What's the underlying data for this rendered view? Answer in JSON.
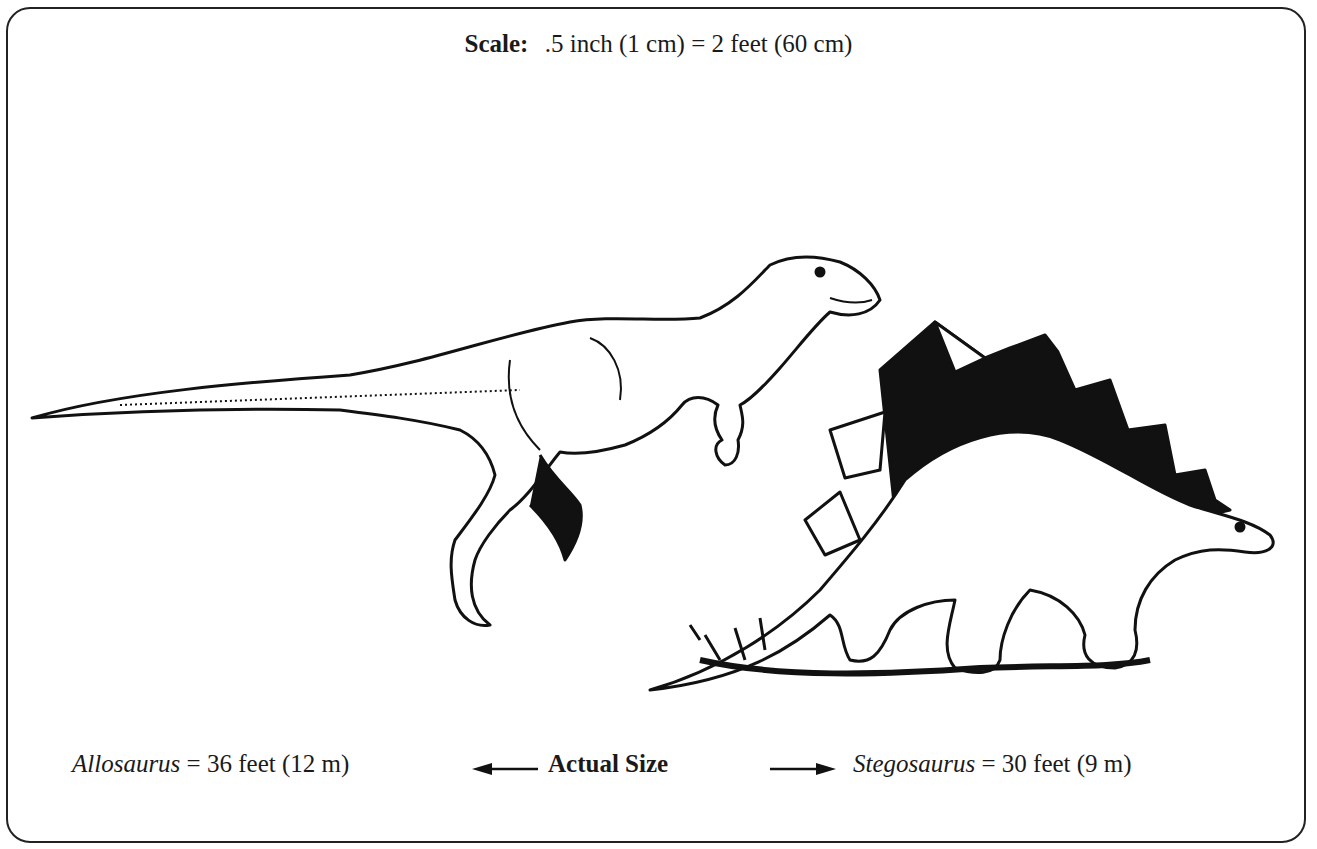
{
  "scale": {
    "label": "Scale:",
    "value": ".5 inch (1 cm) = 2 feet (60 cm)"
  },
  "figures": [
    {
      "name": "Allosaurus",
      "size": "= 36 feet (12 m)",
      "position": "left"
    },
    {
      "name": "Stegosaurus",
      "size": "= 30 feet (9 m)",
      "position": "right"
    }
  ],
  "center_label": "Actual Size",
  "arrows": {
    "left": "left-arrow",
    "right": "right-arrow"
  },
  "colors": {
    "ink": "#1a1a1a",
    "paper": "#ffffff"
  }
}
